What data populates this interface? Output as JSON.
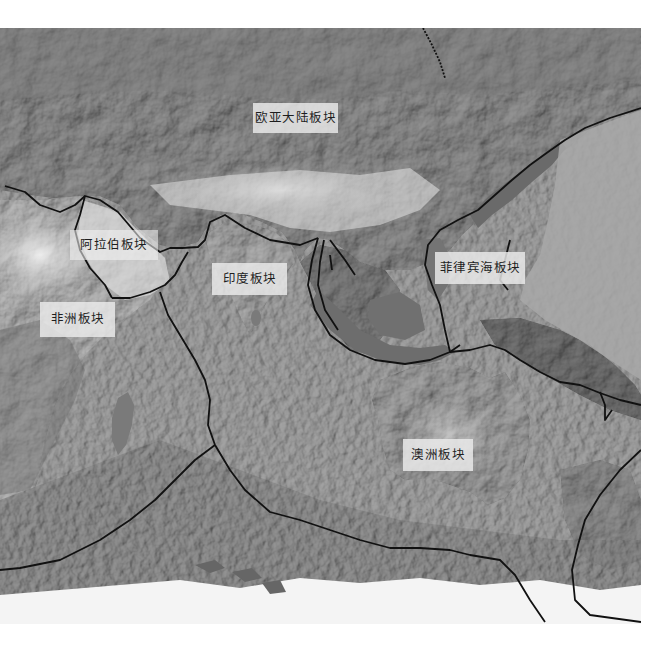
{
  "map": {
    "type": "tectonic-plate-relief-map",
    "color_mode": "grayscale",
    "background": "#ffffff",
    "boundary_color": "#111111",
    "labels": [
      {
        "id": "eurasian",
        "text": "欧亚大陆板块",
        "x": 253,
        "y": 103,
        "w": 85,
        "h": 30
      },
      {
        "id": "arabian",
        "text": "阿拉伯板块",
        "x": 70,
        "y": 230,
        "w": 88,
        "h": 30
      },
      {
        "id": "indian",
        "text": "印度板块",
        "x": 212,
        "y": 263,
        "w": 75,
        "h": 32
      },
      {
        "id": "philippine-sea",
        "text": "菲律宾海板块",
        "x": 435,
        "y": 252,
        "w": 90,
        "h": 32
      },
      {
        "id": "african",
        "text": "非洲板块",
        "x": 40,
        "y": 302,
        "w": 75,
        "h": 35
      },
      {
        "id": "australian",
        "text": "澳洲板块",
        "x": 403,
        "y": 439,
        "w": 70,
        "h": 32
      }
    ]
  }
}
